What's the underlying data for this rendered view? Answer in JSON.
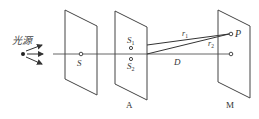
{
  "diagram": {
    "stroke_color": "#444444",
    "background": "#ffffff",
    "source": {
      "label": "光源",
      "x": 22,
      "y": 54
    },
    "screens": [
      {
        "id": "screen-s",
        "label": "",
        "hole_label": "S",
        "corners": [
          [
            65,
            10
          ],
          [
            97,
            26
          ],
          [
            97,
            95
          ],
          [
            65,
            79
          ]
        ]
      },
      {
        "id": "screen-a",
        "label": "A",
        "slit_labels": [
          "S1",
          "S2"
        ],
        "corners": [
          [
            115,
            11
          ],
          [
            147,
            27
          ],
          [
            147,
            100
          ],
          [
            115,
            84
          ]
        ]
      },
      {
        "id": "screen-m",
        "label": "M",
        "point_label": "P",
        "corners": [
          [
            218,
            10
          ],
          [
            250,
            26
          ],
          [
            250,
            98
          ],
          [
            218,
            82
          ]
        ]
      }
    ],
    "labels": {
      "source": "光源",
      "s": "S",
      "s1_main": "S",
      "s1_sub": "1",
      "s2_main": "S",
      "s2_sub": "2",
      "r1_main": "r",
      "r1_sub": "1",
      "r2_main": "r",
      "r2_sub": "2",
      "d": "D",
      "p": "P",
      "a": "A",
      "m": "M"
    }
  }
}
